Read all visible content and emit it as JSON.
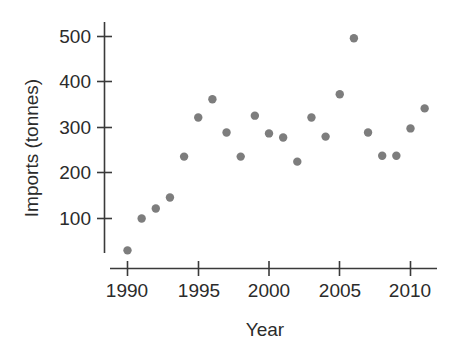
{
  "chart_data": {
    "type": "scatter",
    "title": "",
    "subtitle": "",
    "xlabel": "Year",
    "ylabel": "Imports (tonnes)",
    "xlim": [
      1989.0,
      1989.0
    ],
    "ylim": [
      0,
      540
    ],
    "grid": false,
    "legend": null,
    "legend_position": "none",
    "marker": {
      "shape": "circle",
      "color": "#7d7d7d",
      "radius_px": 4.2
    },
    "x_ticks": [
      1990,
      1995,
      2000,
      2005,
      2010
    ],
    "x_tick_labels": [
      "1990",
      "1995",
      "2000",
      "2005",
      "2010"
    ],
    "y_ticks": [
      100,
      200,
      300,
      400,
      500
    ],
    "y_tick_labels": [
      "100",
      "200",
      "300",
      "400",
      "500"
    ],
    "x": [
      1990,
      1991,
      1992,
      1993,
      1994,
      1995,
      1996,
      1997,
      1998,
      1999,
      2000,
      2001,
      2002,
      2003,
      2004,
      2005,
      2006,
      2007,
      2008,
      2009,
      2010,
      2011
    ],
    "values": [
      30,
      100,
      122,
      146,
      236,
      322,
      362,
      289,
      236,
      326,
      287,
      278,
      225,
      322,
      280,
      373,
      496,
      289,
      238,
      238,
      298,
      342
    ],
    "points": [
      {
        "year": 1990,
        "imports": 30
      },
      {
        "year": 1991,
        "imports": 100
      },
      {
        "year": 1992,
        "imports": 122
      },
      {
        "year": 1993,
        "imports": 146
      },
      {
        "year": 1994,
        "imports": 236
      },
      {
        "year": 1995,
        "imports": 322
      },
      {
        "year": 1996,
        "imports": 362
      },
      {
        "year": 1997,
        "imports": 289
      },
      {
        "year": 1998,
        "imports": 236
      },
      {
        "year": 1999,
        "imports": 326
      },
      {
        "year": 2000,
        "imports": 287
      },
      {
        "year": 2001,
        "imports": 278
      },
      {
        "year": 2002,
        "imports": 225
      },
      {
        "year": 2003,
        "imports": 322
      },
      {
        "year": 2004,
        "imports": 280
      },
      {
        "year": 2005,
        "imports": 373
      },
      {
        "year": 2006,
        "imports": 496
      },
      {
        "year": 2007,
        "imports": 289
      },
      {
        "year": 2008,
        "imports": 238
      },
      {
        "year": 2009,
        "imports": 238
      },
      {
        "year": 2010,
        "imports": 298
      },
      {
        "year": 2011,
        "imports": 342
      }
    ]
  },
  "axes": {
    "x_title": "Year",
    "y_title": "Imports (tonnes)"
  },
  "colors": {
    "marker": "#7d7d7d",
    "axis": "#3a3a3a",
    "text": "#2b2b2b",
    "background": "#ffffff"
  }
}
